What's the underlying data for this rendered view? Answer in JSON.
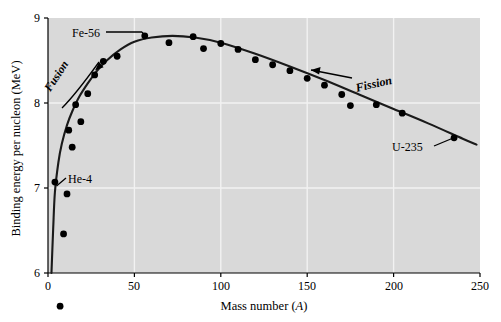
{
  "chart_data": {
    "type": "scatter",
    "title": "",
    "xlabel": "Mass number (A)",
    "ylabel": "Binding energy per nucleon (MeV)",
    "xlim": [
      0,
      250
    ],
    "ylim": [
      6,
      9
    ],
    "xticks": [
      0,
      50,
      100,
      150,
      200,
      250
    ],
    "yticks": [
      6,
      7,
      8,
      9
    ],
    "grid": true,
    "legend": "none",
    "plot_background": "#d9d9d9",
    "series": [
      {
        "name": "Binding energy per nucleon",
        "marker": "filled-circle",
        "color": "#000000",
        "points": [
          {
            "x": 4,
            "y": 7.07,
            "label": "He-4"
          },
          {
            "x": 7,
            "y": 5.61,
            "label": ""
          },
          {
            "x": 9,
            "y": 6.46,
            "label": ""
          },
          {
            "x": 11,
            "y": 6.93,
            "label": ""
          },
          {
            "x": 12,
            "y": 7.68,
            "label": ""
          },
          {
            "x": 14,
            "y": 7.48,
            "label": ""
          },
          {
            "x": 16,
            "y": 7.98,
            "label": ""
          },
          {
            "x": 19,
            "y": 7.78,
            "label": ""
          },
          {
            "x": 23,
            "y": 8.11,
            "label": ""
          },
          {
            "x": 27,
            "y": 8.33,
            "label": ""
          },
          {
            "x": 32,
            "y": 8.49,
            "label": ""
          },
          {
            "x": 40,
            "y": 8.55,
            "label": ""
          },
          {
            "x": 56,
            "y": 8.79,
            "label": "Fe-56"
          },
          {
            "x": 70,
            "y": 8.71,
            "label": ""
          },
          {
            "x": 84,
            "y": 8.78,
            "label": ""
          },
          {
            "x": 90,
            "y": 8.64,
            "label": ""
          },
          {
            "x": 100,
            "y": 8.7,
            "label": ""
          },
          {
            "x": 110,
            "y": 8.63,
            "label": ""
          },
          {
            "x": 120,
            "y": 8.51,
            "label": ""
          },
          {
            "x": 130,
            "y": 8.45,
            "label": ""
          },
          {
            "x": 140,
            "y": 8.38,
            "label": ""
          },
          {
            "x": 150,
            "y": 8.29,
            "label": ""
          },
          {
            "x": 160,
            "y": 8.21,
            "label": ""
          },
          {
            "x": 170,
            "y": 8.1,
            "label": ""
          },
          {
            "x": 175,
            "y": 7.97,
            "label": ""
          },
          {
            "x": 190,
            "y": 7.98,
            "label": ""
          },
          {
            "x": 205,
            "y": 7.88,
            "label": ""
          },
          {
            "x": 235,
            "y": 7.59,
            "label": "U-235"
          }
        ]
      }
    ],
    "fit_curve": {
      "name": "smooth binding energy curve",
      "color": "#1a1a1a",
      "points": [
        {
          "x": 2,
          "y": 6.0
        },
        {
          "x": 3,
          "y": 6.52
        },
        {
          "x": 4,
          "y": 6.95
        },
        {
          "x": 6,
          "y": 7.3
        },
        {
          "x": 8,
          "y": 7.52
        },
        {
          "x": 11,
          "y": 7.74
        },
        {
          "x": 14,
          "y": 7.9
        },
        {
          "x": 18,
          "y": 8.07
        },
        {
          "x": 23,
          "y": 8.23
        },
        {
          "x": 28,
          "y": 8.37
        },
        {
          "x": 34,
          "y": 8.5
        },
        {
          "x": 42,
          "y": 8.63
        },
        {
          "x": 50,
          "y": 8.72
        },
        {
          "x": 60,
          "y": 8.77
        },
        {
          "x": 72,
          "y": 8.79
        },
        {
          "x": 85,
          "y": 8.77
        },
        {
          "x": 100,
          "y": 8.71
        },
        {
          "x": 120,
          "y": 8.58
        },
        {
          "x": 140,
          "y": 8.43
        },
        {
          "x": 160,
          "y": 8.27
        },
        {
          "x": 180,
          "y": 8.1
        },
        {
          "x": 200,
          "y": 7.93
        },
        {
          "x": 220,
          "y": 7.76
        },
        {
          "x": 240,
          "y": 7.58
        },
        {
          "x": 248,
          "y": 7.51
        }
      ]
    },
    "annotations": [
      {
        "name": "fe-56-label",
        "text": "Fe-56",
        "style": "plain"
      },
      {
        "name": "he-4-label",
        "text": "He-4",
        "style": "plain"
      },
      {
        "name": "u-235-label",
        "text": "U-235",
        "style": "plain"
      },
      {
        "name": "fusion-label",
        "text": "Fusion",
        "style": "bold-italic"
      },
      {
        "name": "fission-label",
        "text": "Fission",
        "style": "bold-italic"
      }
    ]
  },
  "axes": {
    "x_tick_labels": [
      "0",
      "50",
      "100",
      "150",
      "200",
      "250"
    ],
    "y_tick_labels": [
      "9",
      "8",
      "7",
      "6"
    ],
    "x_title_text": "Mass number (",
    "x_title_italic": "A",
    "x_title_tail": ")",
    "y_title": "Binding energy per nucleon (MeV)"
  },
  "annotation_text": {
    "fe56": "Fe-56",
    "he4": "He-4",
    "u235": "U-235",
    "fusion": "Fusion",
    "fission": "Fission"
  }
}
